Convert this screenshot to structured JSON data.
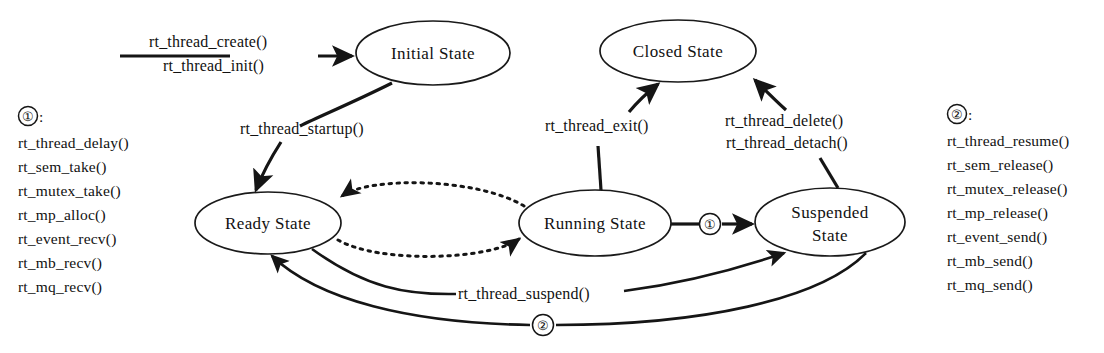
{
  "diagram": {
    "states": [
      {
        "id": "initial",
        "label": "Initial State",
        "label2": "",
        "cx": 433,
        "cy": 53,
        "rx": 77,
        "ry": 32
      },
      {
        "id": "closed",
        "label": "Closed State",
        "label2": "",
        "cx": 678,
        "cy": 51,
        "rx": 78,
        "ry": 31
      },
      {
        "id": "ready",
        "label": "Ready State",
        "label2": "",
        "cx": 268,
        "cy": 223,
        "rx": 73,
        "ry": 31
      },
      {
        "id": "running",
        "label": "Running State",
        "label2": "",
        "cx": 595,
        "cy": 223,
        "rx": 76,
        "ry": 33
      },
      {
        "id": "suspended",
        "label": "Suspended",
        "label2": "State",
        "cx": 830,
        "cy": 222,
        "rx": 75,
        "ry": 34
      }
    ],
    "edges": [
      {
        "id": "create",
        "label1": "rt_thread_create()",
        "label2": "rt_thread_init()",
        "from": "",
        "to": "initial"
      },
      {
        "id": "startup",
        "label1": "rt_thread_startup()",
        "label2": "",
        "from": "initial",
        "to": "ready"
      },
      {
        "id": "exit",
        "label1": "rt_thread_exit()",
        "label2": "",
        "from": "running",
        "to": "closed"
      },
      {
        "id": "delete",
        "label1": "rt_thread_delete()",
        "label2": "rt_thread_detach()",
        "from": "suspended",
        "to": "closed"
      },
      {
        "id": "suspend",
        "label1": "rt_thread_suspend()",
        "label2": "",
        "from": "ready",
        "to": "suspended"
      },
      {
        "id": "block",
        "label1": "①",
        "label2": "",
        "from": "running",
        "to": "suspended"
      },
      {
        "id": "resume",
        "label1": "②",
        "label2": "",
        "from": "suspended",
        "to": "ready"
      },
      {
        "id": "schedule-in",
        "label1": "",
        "label2": "",
        "from": "ready",
        "to": "running"
      },
      {
        "id": "schedule-out",
        "label1": "",
        "label2": "",
        "from": "running",
        "to": "ready"
      }
    ],
    "legends": [
      {
        "id": "legend-one",
        "marker": "①",
        "separator": ":",
        "items": [
          "rt_thread_delay()",
          "rt_sem_take()",
          "rt_mutex_take()",
          "rt_mp_alloc()",
          "rt_event_recv()",
          "rt_mb_recv()",
          "rt_mq_recv()"
        ]
      },
      {
        "id": "legend-two",
        "marker": "②",
        "separator": ":",
        "items": [
          "rt_thread_resume()",
          "rt_sem_release()",
          "rt_mutex_release()",
          "rt_mp_release()",
          "rt_event_send()",
          "rt_mb_send()",
          "rt_mq_send()"
        ]
      }
    ],
    "colors": {
      "stroke": "#151515",
      "fill": "#ffffff",
      "text": "#111111"
    }
  }
}
